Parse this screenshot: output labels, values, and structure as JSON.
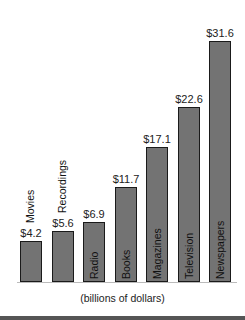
{
  "chart_data": {
    "type": "bar",
    "title": "",
    "xlabel": "(billions of dollars)",
    "ylabel": "",
    "categories": [
      "Movies",
      "Recordings",
      "Radio",
      "Books",
      "Magazines",
      "Television",
      "Newspapers"
    ],
    "values": [
      4.2,
      5.6,
      6.9,
      11.7,
      17.1,
      22.6,
      31.6
    ],
    "value_labels": [
      "$4.2",
      "$5.6",
      "$6.9",
      "$11.7",
      "$17.1",
      "$22.6",
      "$31.6"
    ],
    "grid": false,
    "legend": null,
    "bar_color": "#737373",
    "bar_border_color": "#1a1a1a"
  }
}
